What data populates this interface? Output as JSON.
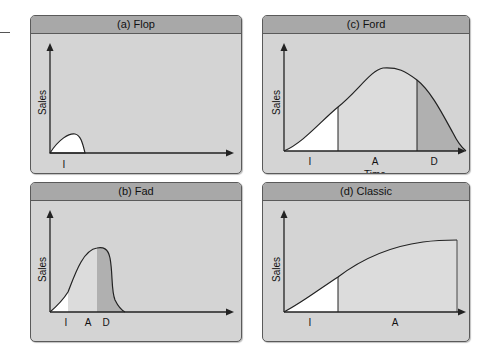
{
  "panels": {
    "a": {
      "title": "(a) Flop",
      "ylabel": "Sales",
      "stages": [
        "I"
      ]
    },
    "b": {
      "title": "(b) Fad",
      "ylabel": "Sales",
      "stages": [
        "I",
        "A",
        "D"
      ]
    },
    "c": {
      "title": "(c) Ford",
      "ylabel": "Sales",
      "xlabel": "Time",
      "stages": [
        "I",
        "A",
        "D"
      ]
    },
    "d": {
      "title": "(d) Classic",
      "ylabel": "Sales",
      "stages": [
        "I",
        "A"
      ]
    }
  },
  "colors": {
    "panel_bg": "#d4d4d4",
    "header_bg": "#a8a8a8",
    "intro_fill": "#ffffff",
    "accept_fill": "#dcdcdc",
    "decline_fill": "#b0b0b0",
    "line": "#222222"
  }
}
